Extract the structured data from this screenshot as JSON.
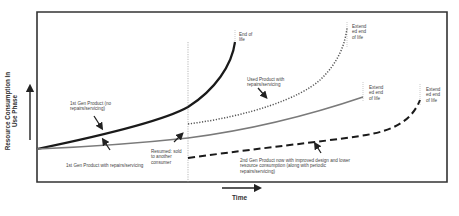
{
  "diagram": {
    "type": "line-diagram",
    "axes": {
      "x_label": "Time",
      "y_label": "Resource Consumption In Use Phase"
    },
    "colors": {
      "frame": "#333333",
      "first_gen_no_repair": "#1a1a1a",
      "first_gen_repair": "#7a7a7a",
      "used_product": "#555555",
      "second_gen": "#1a1a1a",
      "marker_lines": "#999999"
    },
    "series": [
      {
        "name": "1st Gen Product (no repairs/servicing)",
        "style": "solid-thick-black"
      },
      {
        "name": "1st Gen Product with repairs/servicing",
        "style": "solid-gray"
      },
      {
        "name": "Used Product with repairs/servicing",
        "style": "dotted"
      },
      {
        "name": "2nd Gen Product now with improved design and lower resource consumption (along with periodic repairs/servicing)",
        "style": "dashed-thick"
      }
    ],
    "labels": {
      "first_gen_no_repair": "1st Gen Product (no\nrepairs/servicing)",
      "first_gen_no_repair_sup": "st",
      "first_gen_repair": "1st Gen Product with repairs/servicing",
      "resumed": "Resumed: sold\nto another\nconsumer",
      "end_of_life": "End of\nlife",
      "extended_1": "Extend\ned end\nof life",
      "used_product": "Used Product with\nrepairs/servicing",
      "extended_2": "Extend\ned end\nof life",
      "extended_3": "Extend\ned end\nof life",
      "second_gen": "2nd Gen Product now with improved design and lower\nresource consumption (along with periodic\nrepairs/servicing)"
    }
  }
}
